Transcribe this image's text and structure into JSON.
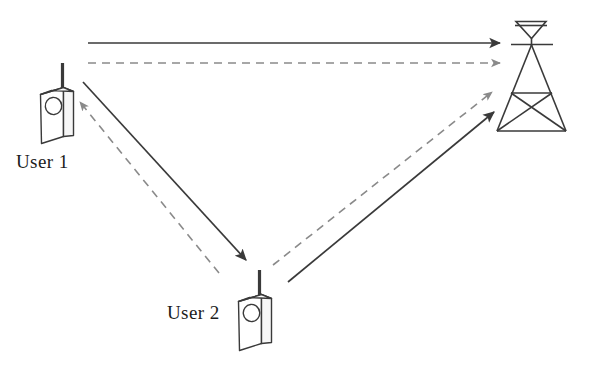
{
  "diagram": {
    "background_color": "#ffffff",
    "line_color": "#3a3a3a",
    "dashed_line_color": "#8a8a8a",
    "text_color": "#1c1c1c",
    "nodes": [
      {
        "id": "user1",
        "label": "User 1",
        "icon": "mobile-phone-icon",
        "label_x": 16,
        "label_y": 152,
        "body": {
          "x": 40,
          "y": 88,
          "width": 34,
          "height": 54
        },
        "antenna": {
          "x": 62,
          "y_top": 63,
          "y_bottom": 90
        },
        "button": {
          "cx": 55,
          "cy": 104,
          "r": 8
        }
      },
      {
        "id": "user2",
        "label": "User 2",
        "icon": "mobile-phone-icon",
        "label_x": 167,
        "label_y": 303,
        "body": {
          "x": 238,
          "y": 295,
          "width": 34,
          "height": 54
        },
        "antenna": {
          "x": 259,
          "y_top": 270,
          "y_bottom": 297
        },
        "button": {
          "cx": 253,
          "cy": 311,
          "r": 8
        }
      },
      {
        "id": "base-station",
        "label": "",
        "icon": "cell-tower-icon",
        "apex_x": 531,
        "apex_y": 45,
        "dish_top_y": 22,
        "dish_left_x": 516,
        "dish_right_x": 546,
        "crossbar_y": 44,
        "crossbar_left_x": 512,
        "crossbar_right_x": 553,
        "mid_bar_y": 93,
        "mid_bar_left_x": 511,
        "mid_bar_right_x": 552,
        "base_y": 131,
        "base_left_x": 497,
        "base_right_x": 566
      }
    ],
    "links": [
      {
        "id": "user1-to-tower-solid",
        "style": "solid",
        "from": "user1",
        "to": "base-station",
        "x1": 88,
        "y1": 43,
        "x2": 500,
        "y2": 43
      },
      {
        "id": "tower-to-user1-dashed",
        "style": "dashed",
        "from": "base-station",
        "to": "user1",
        "x1": 88,
        "y1": 63,
        "x2": 500,
        "y2": 63
      },
      {
        "id": "user1-to-user2-solid",
        "style": "solid",
        "from": "user1",
        "to": "user2",
        "x1": 83,
        "y1": 82,
        "x2": 246,
        "y2": 260
      },
      {
        "id": "user2-to-user1-dashed",
        "style": "dashed",
        "from": "user2",
        "to": "user1",
        "x1": 219,
        "y1": 273,
        "x2": 80,
        "y2": 102
      },
      {
        "id": "user2-to-tower-solid",
        "style": "solid",
        "from": "user2",
        "to": "base-station",
        "x1": 288,
        "y1": 282,
        "x2": 494,
        "y2": 112
      },
      {
        "id": "user2-to-tower-dashed",
        "style": "dashed",
        "from": "user2",
        "to": "base-station",
        "x1": 273,
        "y1": 265,
        "x2": 492,
        "y2": 92
      }
    ]
  }
}
